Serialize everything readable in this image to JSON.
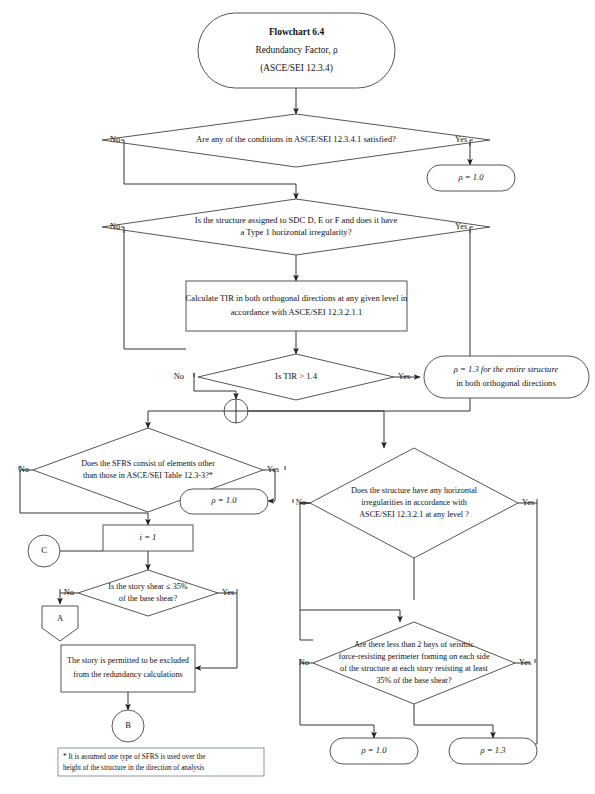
{
  "title_block": {
    "line1": "Flowchart 6.4",
    "line2": "Redundancy Factor, ρ",
    "line3": "(ASCE/SEI 12.3.4)"
  },
  "labels": {
    "yes": "Yes",
    "no": "No"
  },
  "decisions": [
    {
      "id": "d1",
      "lines": [
        "Are any of the conditions in ASCE/SEI 12.3.4.1 satisfied?"
      ]
    },
    {
      "id": "d2",
      "lines": [
        "Is the structure assigned to SDC D, E or F and does it have",
        "a Type 1 horizontal irregularity?"
      ]
    },
    {
      "id": "d3",
      "lines": [
        "Is TIR > 1.4"
      ]
    },
    {
      "id": "d4",
      "lines": [
        "Does the SFRS consist of elements other",
        "than those in ASCE/SEI Table 12.3-3?*"
      ]
    },
    {
      "id": "d5",
      "lines": [
        "Does the structure have any horizontal",
        "irregularities in accordance with",
        "ASCE/SEI 12.3.2.1 at any level ?"
      ]
    },
    {
      "id": "d6",
      "lines": [
        "Is the story shear ≤ 35%",
        "of the base shear?"
      ]
    },
    {
      "id": "d7",
      "lines": [
        "Are there less than 2 bays of seismic",
        "force-resisting perimeter framing on each side",
        "of the structure at each story resisting at least",
        "35% of the base shear?"
      ]
    }
  ],
  "processes": [
    {
      "id": "p1",
      "lines": [
        "Calculate TIR in both orthogonal directions at any given level in",
        "accordance with ASCE/SEI 12.3.2.1.1"
      ]
    },
    {
      "id": "p2",
      "lines": [
        "i = 1"
      ]
    },
    {
      "id": "p3",
      "lines": [
        "The story is permitted to be excluded",
        "from the redundancy calculations"
      ]
    }
  ],
  "terminals": [
    {
      "id": "r1",
      "lines": [
        "ρ = 1.0"
      ]
    },
    {
      "id": "r2",
      "lines": [
        "ρ = 1.3 for the entire structure",
        "in both orthogonal directions"
      ]
    },
    {
      "id": "r3",
      "lines": [
        "ρ = 1.0"
      ]
    },
    {
      "id": "r4",
      "lines": [
        "ρ = 1.0"
      ]
    },
    {
      "id": "r5",
      "lines": [
        "ρ = 1.3"
      ]
    }
  ],
  "connectors": [
    {
      "id": "cC",
      "label": "C",
      "shape": "circle"
    },
    {
      "id": "cA",
      "label": "A",
      "shape": "pentagon-down"
    },
    {
      "id": "cB",
      "label": "B",
      "shape": "circle"
    },
    {
      "id": "cJunction",
      "label": "",
      "shape": "crossed-circle"
    }
  ],
  "footnote": {
    "lines": [
      "* It is assumed one type of SFRS is used over the",
      "height of the structure in the direction of analysis"
    ]
  },
  "colors": {
    "stroke": "#555555",
    "line": "#333333",
    "text": "#111111",
    "note_border": "#7d8ca3",
    "background": "#ffffff"
  }
}
